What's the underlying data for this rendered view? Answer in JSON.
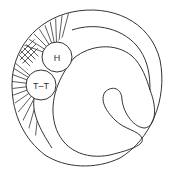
{
  "diagram": {
    "labels": {
      "upper_circle": "H",
      "lower_circle": "T–T"
    },
    "colors": {
      "stroke": "#333333",
      "background": "#ffffff"
    }
  }
}
